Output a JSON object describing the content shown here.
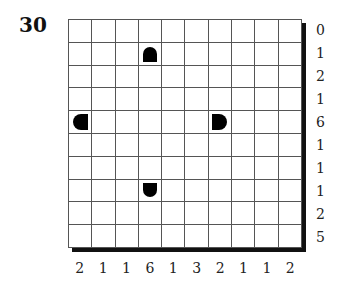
{
  "puzzle": {
    "number": "30",
    "rows": 10,
    "cols": 10,
    "row_clues": [
      "0",
      "1",
      "2",
      "1",
      "6",
      "1",
      "1",
      "1",
      "2",
      "5"
    ],
    "col_clues": [
      "2",
      "1",
      "1",
      "6",
      "1",
      "3",
      "2",
      "1",
      "1",
      "2"
    ],
    "given_pieces": [
      {
        "row": 1,
        "col": 3,
        "shape": "top"
      },
      {
        "row": 4,
        "col": 0,
        "shape": "left"
      },
      {
        "row": 4,
        "col": 6,
        "shape": "right"
      },
      {
        "row": 7,
        "col": 3,
        "shape": "bottom"
      }
    ],
    "colors": {
      "ink": "#000000",
      "grid_line": "#555555",
      "background": "#ffffff"
    }
  }
}
